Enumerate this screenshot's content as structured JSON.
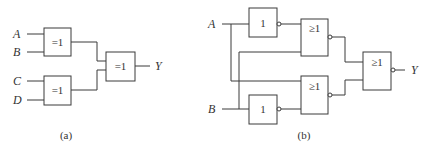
{
  "diagram_a": {
    "caption": "(a)",
    "inputs": [
      "A",
      "B",
      "C",
      "D"
    ],
    "output": "Y",
    "gates": [
      {
        "id": "xor1",
        "symbol": "=1",
        "inputs": [
          "A",
          "B"
        ]
      },
      {
        "id": "xor2",
        "symbol": "=1",
        "inputs": [
          "C",
          "D"
        ]
      },
      {
        "id": "xor3",
        "symbol": "=1",
        "inputs": [
          "xor1",
          "xor2"
        ],
        "output": "Y"
      }
    ]
  },
  "diagram_b": {
    "caption": "(b)",
    "inputs": [
      "A",
      "B"
    ],
    "output": "Y",
    "gates": [
      {
        "id": "not1",
        "symbol": "1",
        "inverted_output": true,
        "inputs": [
          "A"
        ]
      },
      {
        "id": "nor1",
        "symbol": "≥1",
        "inverted_output": true,
        "inputs": [
          "not1",
          "B"
        ]
      },
      {
        "id": "nor2",
        "symbol": "≥1",
        "inverted_output": true,
        "inputs": [
          "A",
          "not2"
        ]
      },
      {
        "id": "not2",
        "symbol": "1",
        "inverted_output": true,
        "inputs": [
          "B"
        ]
      },
      {
        "id": "nor3",
        "symbol": "≥1",
        "inverted_output": true,
        "inputs": [
          "nor1",
          "nor2"
        ],
        "output": "Y"
      }
    ]
  }
}
